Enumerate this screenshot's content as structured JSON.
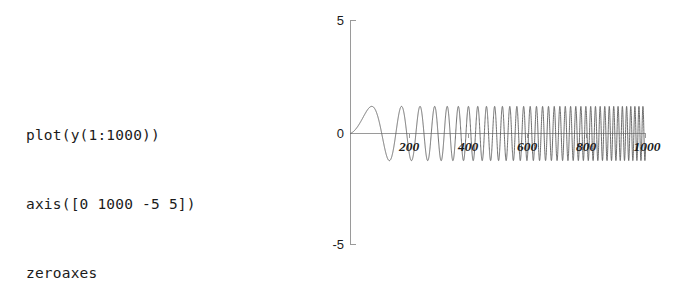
{
  "code_listing": {
    "language": "matlab",
    "lines": [
      "plot(y(1:1000))",
      "axis([0 1000 -5 5])",
      "zeroaxes"
    ]
  },
  "plot": {
    "y_axis": {
      "labels": [
        "5",
        "0",
        "-5"
      ],
      "top_label": "5",
      "zero_label": "0",
      "bottom_label": "-5"
    },
    "x_axis": {
      "labels": [
        "200",
        "400",
        "600",
        "800",
        "1000"
      ]
    }
  },
  "chart_data": {
    "type": "line",
    "title": "",
    "xlabel": "",
    "ylabel": "",
    "xlim": [
      0,
      1000
    ],
    "ylim": [
      -5,
      5
    ],
    "xticks": [
      200,
      400,
      600,
      800,
      1000
    ],
    "yticks": [
      -5,
      0,
      5
    ],
    "grid": false,
    "legend": null,
    "axes_style": "zeroaxes",
    "series": [
      {
        "name": "y(1:1000)",
        "description": "chirp: amplitude approximately 1.2, frequency sweeping upward from low to high across samples 1 to 1000",
        "amplitude": 1.2,
        "samples": 1000,
        "x": [
          0,
          1000
        ],
        "waveform": "chirp"
      }
    ]
  },
  "colors": {
    "background": "#ffffff",
    "axis": "#9a9a9a",
    "trace": "#5d5d5d",
    "text": "#1b1b1b"
  }
}
